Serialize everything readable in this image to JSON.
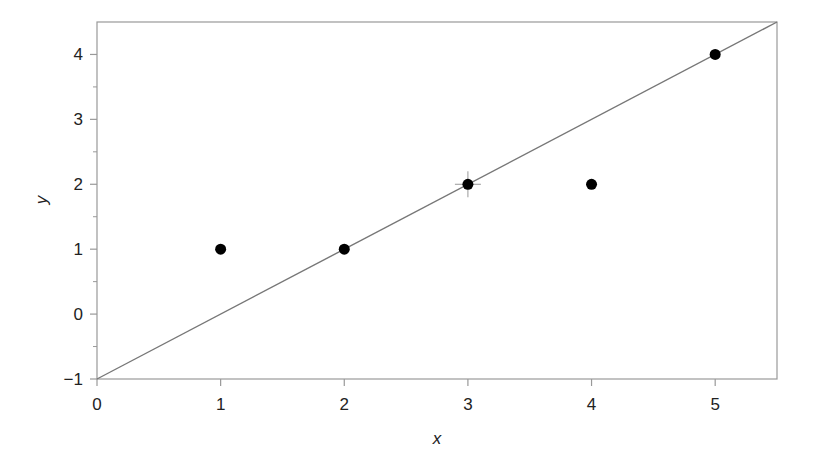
{
  "chart_data": {
    "type": "scatter",
    "title": "",
    "xlabel": "x",
    "ylabel": "y",
    "xlim": [
      0,
      5.5
    ],
    "ylim": [
      -1,
      4.5
    ],
    "grid": false,
    "legend": null,
    "x_ticks": [
      0,
      1,
      2,
      3,
      4,
      5
    ],
    "x_tick_labels": [
      "0",
      "1",
      "2",
      "3",
      "4",
      "5"
    ],
    "y_ticks": [
      -1,
      0,
      1,
      2,
      3,
      4
    ],
    "y_tick_labels": [
      "−1",
      "0",
      "1",
      "2",
      "3",
      "4"
    ],
    "y_minor_ticks": [
      -0.5,
      0.5,
      1.5,
      2.5,
      3.5
    ],
    "series": [
      {
        "name": "points",
        "type": "scatter",
        "x": [
          1,
          2,
          3,
          4,
          5
        ],
        "y": [
          1,
          1,
          2,
          2,
          4
        ],
        "color": "#000000"
      },
      {
        "name": "fitted line",
        "type": "line",
        "equation": "y = x - 1",
        "x": [
          0,
          5.5
        ],
        "y": [
          -1,
          4.5
        ],
        "color": "#777777"
      }
    ],
    "annotations": [
      {
        "type": "crosshair-marker",
        "x": 3,
        "y": 2
      }
    ]
  },
  "colors": {
    "axis": "#999999",
    "line": "#777777",
    "point": "#000000",
    "text": "#222222"
  }
}
